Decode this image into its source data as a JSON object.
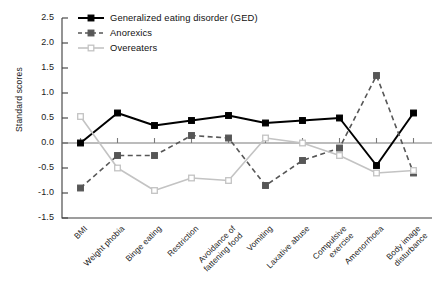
{
  "chart_data": {
    "type": "line",
    "title": "",
    "xlabel": "",
    "ylabel": "Standard scores",
    "ylim": [
      -1.5,
      2.5
    ],
    "yticks": [
      "2.5",
      "2.0",
      "1.5",
      "1.0",
      "0.5",
      "0.0",
      "-0.5",
      "-1.0",
      "-1.5"
    ],
    "ytick_values": [
      2.5,
      2.0,
      1.5,
      1.0,
      0.5,
      0.0,
      -0.5,
      -1.0,
      -1.5
    ],
    "grid": false,
    "legend_position": "top-center",
    "categories": [
      "BMI",
      "Weight phobia",
      "Binge eating",
      "Restriction",
      "Avoidance of\nfattening food",
      "Vomiting",
      "Laxative abuse",
      "Compulsive\nexercise",
      "Amenorrhoea",
      "Body image\ndisturbance"
    ],
    "series": [
      {
        "name": "Generalized eating disorder (GED)",
        "color": "#000000",
        "dash": "solid",
        "marker": "filled-square",
        "values": [
          0.0,
          0.6,
          0.35,
          0.45,
          0.55,
          0.4,
          0.45,
          0.5,
          -0.45,
          0.6
        ]
      },
      {
        "name": "Anorexics",
        "color": "#575757",
        "dash": "dashed",
        "marker": "filled-square",
        "values": [
          -0.9,
          -0.25,
          -0.25,
          0.15,
          0.1,
          -0.85,
          -0.35,
          -0.1,
          1.35,
          -0.6
        ]
      },
      {
        "name": "Overeaters",
        "color": "#c3c3c3",
        "dash": "solid",
        "marker": "open-square",
        "values": [
          0.53,
          -0.5,
          -0.95,
          -0.7,
          -0.75,
          0.1,
          0.0,
          -0.25,
          -0.6,
          -0.55
        ]
      }
    ]
  },
  "axis": {
    "y_axis_title": "Standard scores"
  }
}
